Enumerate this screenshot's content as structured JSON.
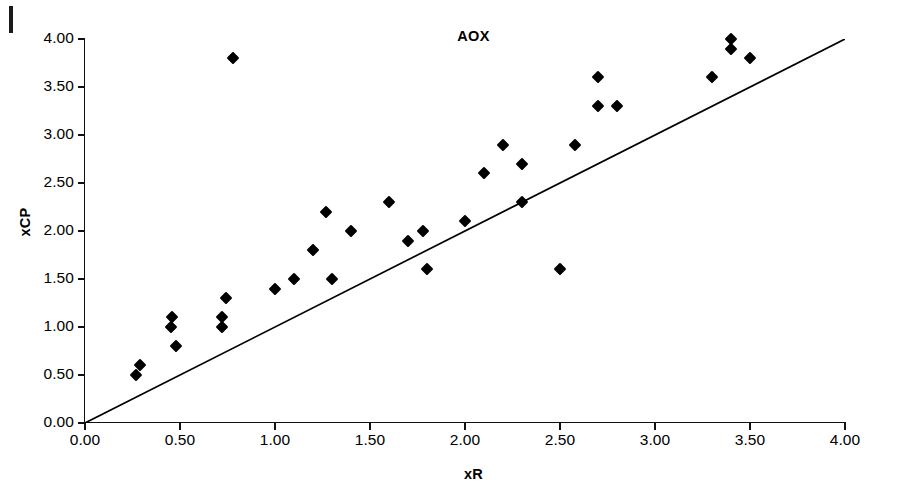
{
  "chart_data": {
    "type": "scatter",
    "title": "AOX",
    "xlabel": "xR",
    "ylabel": "xCP",
    "xlim": [
      0,
      4
    ],
    "ylim": [
      0,
      4
    ],
    "xticks": [
      0,
      0.5,
      1,
      1.5,
      2,
      2.5,
      3,
      3.5,
      4
    ],
    "yticks": [
      0,
      0.5,
      1,
      1.5,
      2,
      2.5,
      3,
      3.5,
      4
    ],
    "xticklabels": [
      "0.00",
      "0.50",
      "1.00",
      "1.50",
      "2.00",
      "2.50",
      "3.00",
      "3.50",
      "4.00"
    ],
    "yticklabels": [
      "0.00",
      "0.50",
      "1.00",
      "1.50",
      "2.00",
      "2.50",
      "3.00",
      "3.50",
      "4.00"
    ],
    "grid": false,
    "legend": "none",
    "marker": "filled-diamond",
    "marker_color": "#000000",
    "series": [
      {
        "name": "xCP vs xR",
        "points": [
          [
            0.27,
            0.5
          ],
          [
            0.29,
            0.6
          ],
          [
            0.45,
            1.0
          ],
          [
            0.46,
            1.1
          ],
          [
            0.48,
            0.8
          ],
          [
            0.72,
            1.0
          ],
          [
            0.72,
            1.1
          ],
          [
            0.74,
            1.3
          ],
          [
            0.78,
            3.8
          ],
          [
            1.0,
            1.4
          ],
          [
            1.1,
            1.5
          ],
          [
            1.2,
            1.8
          ],
          [
            1.27,
            2.2
          ],
          [
            1.3,
            1.5
          ],
          [
            1.4,
            2.0
          ],
          [
            1.6,
            2.3
          ],
          [
            1.7,
            1.9
          ],
          [
            1.78,
            2.0
          ],
          [
            1.8,
            1.6
          ],
          [
            2.0,
            2.1
          ],
          [
            2.1,
            2.6
          ],
          [
            2.2,
            2.9
          ],
          [
            2.3,
            2.7
          ],
          [
            2.3,
            2.3
          ],
          [
            2.5,
            1.6
          ],
          [
            2.58,
            2.9
          ],
          [
            2.7,
            3.6
          ],
          [
            2.7,
            3.3
          ],
          [
            2.8,
            3.3
          ],
          [
            3.3,
            3.6
          ],
          [
            3.4,
            4.0
          ],
          [
            3.4,
            3.9
          ],
          [
            3.5,
            3.8
          ]
        ]
      }
    ],
    "reference_line": {
      "name": "identity-line",
      "from": [
        0,
        0
      ],
      "to": [
        4,
        4
      ],
      "color": "#000000"
    }
  }
}
